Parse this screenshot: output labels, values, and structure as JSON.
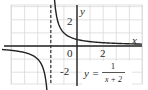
{
  "chart_data": {
    "type": "line",
    "title": "",
    "function_label": "y = 1/(x + 2)",
    "equation": {
      "lhs": "y =",
      "numerator": "1",
      "denominator": "x + 2"
    },
    "xlabel": "x",
    "ylabel": "y",
    "tick_labels": {
      "origin": "0",
      "x": [
        "2"
      ],
      "y": [
        "2",
        "-2"
      ]
    },
    "xlim": [
      -5,
      5
    ],
    "ylim": [
      -3,
      3
    ],
    "grid": true,
    "vertical_asymptote": {
      "x": -2,
      "style": "dashed"
    },
    "horizontal_asymptote": {
      "y": 0
    },
    "series": [
      {
        "name": "y = 1/(x+2), right branch",
        "x": [
          -1.6,
          -1.5,
          -1.0,
          0.0,
          1.0,
          2.0,
          3.0,
          4.0,
          5.0
        ],
        "y": [
          2.5,
          2.0,
          1.0,
          0.5,
          0.33,
          0.25,
          0.2,
          0.17,
          0.14
        ]
      },
      {
        "name": "y = 1/(x+2), left branch",
        "x": [
          -5.0,
          -4.0,
          -3.0,
          -2.5,
          -2.4
        ],
        "y": [
          -0.33,
          -0.5,
          -1.0,
          -2.0,
          -2.5
        ]
      }
    ]
  },
  "colors": {
    "grid": "#d9d9d9",
    "axis": "#222222",
    "curve": "#222222",
    "asymptote": "#333333",
    "background": "#ffffff"
  }
}
